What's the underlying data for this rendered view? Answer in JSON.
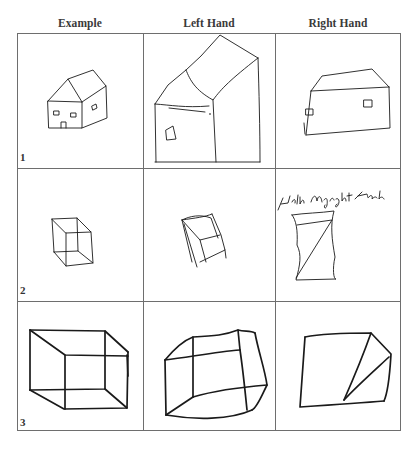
{
  "figure": {
    "columns": [
      {
        "label": "Example"
      },
      {
        "label": "Left Hand"
      },
      {
        "label": "Right Hand"
      }
    ],
    "rows": [
      {
        "number": "1",
        "subject": "house",
        "cells": [
          "house drawing (example)",
          "house drawing (left hand)",
          "house drawing (right hand)"
        ]
      },
      {
        "number": "2",
        "subject": "cube",
        "cells": [
          "wireframe cube (example)",
          "cube drawing (left hand)",
          "cube drawing (right hand)"
        ]
      },
      {
        "number": "3",
        "subject": "box",
        "cells": [
          "large box (example)",
          "large box (left hand)",
          "large box (right hand)"
        ]
      }
    ],
    "annotations": [
      {
        "cell": "row2-right",
        "text": "With my right Hand"
      }
    ]
  }
}
